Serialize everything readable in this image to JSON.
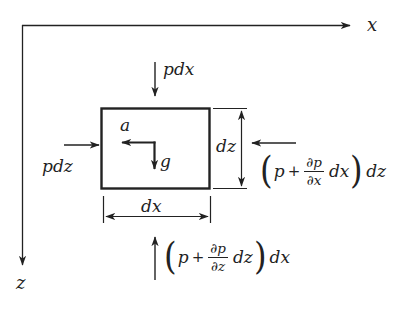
{
  "colors": {
    "ink": "#222222",
    "paper": "#ffffff"
  },
  "axes": {
    "x_label": "x",
    "z_label": "z"
  },
  "element": {
    "acceleration_label": "a",
    "gravity_label": "g"
  },
  "dimensions": {
    "width_label": "dx",
    "height_label": "dz"
  },
  "parens": {
    "open": "(",
    "close": ")"
  },
  "forces": {
    "top_label": "pdx",
    "left_label": "pdz",
    "right": {
      "p": "p",
      "plus": "+",
      "frac_num": "∂p",
      "frac_den": "∂x",
      "dterm": "dx",
      "mult": "dz"
    },
    "bottom": {
      "p": "p",
      "plus": "+",
      "frac_num": "∂p",
      "frac_den": "∂z",
      "dterm": "dz",
      "mult": "dx"
    }
  }
}
